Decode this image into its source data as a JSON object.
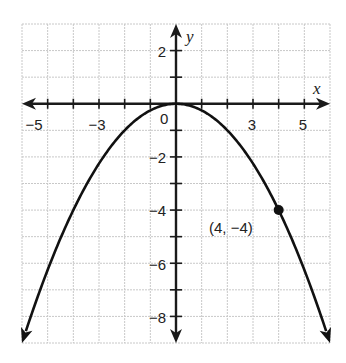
{
  "chart_data": {
    "type": "line",
    "title": "",
    "xlabel": "x",
    "ylabel": "y",
    "xlim": [
      -6,
      6
    ],
    "ylim": [
      -9,
      3
    ],
    "grid": true,
    "x_tick_labels": [
      {
        "value": -5,
        "label": "-5"
      },
      {
        "value": -3,
        "label": "-3"
      },
      {
        "value": 0,
        "label": "0"
      },
      {
        "value": 3,
        "label": "3"
      },
      {
        "value": 5,
        "label": "5"
      }
    ],
    "y_tick_labels": [
      {
        "value": 2,
        "label": "2"
      },
      {
        "value": -2,
        "label": "-2"
      },
      {
        "value": -4,
        "label": "-4"
      },
      {
        "value": -6,
        "label": "-6"
      },
      {
        "value": -8,
        "label": "-8"
      }
    ],
    "series": [
      {
        "name": "parabola",
        "equation": "y = -x^2/4",
        "x": [
          -6,
          -5,
          -4,
          -3,
          -2,
          -1,
          0,
          1,
          2,
          3,
          4,
          5,
          6
        ],
        "y": [
          -9,
          -6.25,
          -4,
          -2.25,
          -1,
          -0.25,
          0,
          -0.25,
          -1,
          -2.25,
          -4,
          -6.25,
          -9
        ],
        "color": "#111111",
        "arrows_at_ends": true
      }
    ],
    "points": [
      {
        "x": 4,
        "y": -4,
        "label": "(4, -4)"
      }
    ],
    "annotations": [
      {
        "text": "(4, -4)",
        "x": 4,
        "y": -4
      }
    ]
  },
  "labels": {
    "x_axis": "x",
    "y_axis": "y",
    "origin": "0",
    "point": "(4, -4)"
  },
  "colors": {
    "grid": "#c8c8c8",
    "axis": "#1a1a1a",
    "curve": "#111111"
  }
}
